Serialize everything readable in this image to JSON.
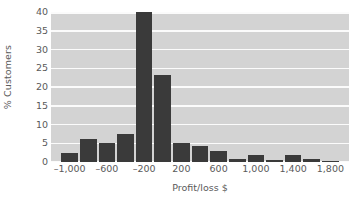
{
  "chart_data": {
    "type": "bar",
    "title": "",
    "subtitle": "",
    "xlabel": "Profit/loss $",
    "ylabel": "% Customers",
    "ylim": [
      0,
      40
    ],
    "yticks": [
      0,
      5,
      10,
      15,
      20,
      25,
      30,
      35,
      40
    ],
    "ytick_labels": [
      "0",
      "5",
      "10",
      "15",
      "20",
      "25",
      "30",
      "35",
      "40"
    ],
    "xlim": [
      -1200,
      2000
    ],
    "xticks": [
      -1000,
      -600,
      -200,
      200,
      600,
      1000,
      1400,
      1800
    ],
    "xtick_labels": [
      "–1,000",
      "–600",
      "–200",
      "200",
      "600",
      "1,000",
      "1,400",
      "1,800"
    ],
    "bin_width": 200,
    "bin_starts": [
      -1100,
      -900,
      -700,
      -500,
      -300,
      -100,
      100,
      300,
      500,
      700,
      900,
      1100,
      1300,
      1500,
      1700
    ],
    "bin_centers": [
      -1000,
      -800,
      -600,
      -400,
      -200,
      0,
      200,
      400,
      600,
      800,
      1000,
      1200,
      1400,
      1600,
      1800
    ],
    "categories": [
      "-1,000",
      "-800",
      "-600",
      "-400",
      "-200",
      "0",
      "200",
      "400",
      "600",
      "800",
      "1,000",
      "1,200",
      "1,400",
      "1,600",
      "1,800"
    ],
    "values": [
      2.3,
      6.2,
      5.1,
      7.4,
      40.3,
      23.3,
      5.0,
      4.3,
      2.9,
      0.8,
      1.8,
      0.6,
      1.8,
      0.7,
      0.3
    ],
    "grid": true,
    "grid_axis": "y",
    "legend": false,
    "legend_position": "none",
    "colors": {
      "bar": "#3a3a3a",
      "plot_background": "#d3d3d3",
      "gridline": "#fbfbfb",
      "figure_background": "#ffffff",
      "text": "#5a5a5a"
    }
  }
}
